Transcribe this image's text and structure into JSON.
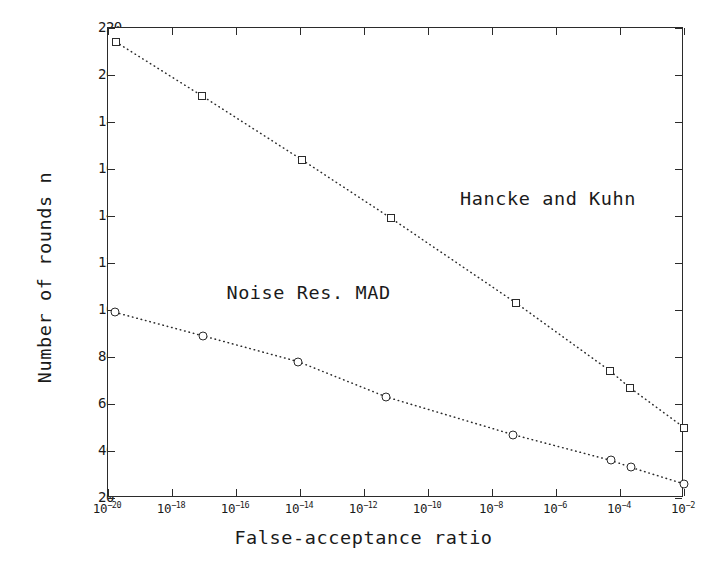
{
  "chart_data": {
    "type": "line",
    "title": "",
    "xlabel": "False-acceptance ratio",
    "ylabel": "Number of rounds n",
    "xscale": "log",
    "xlim": [
      1e-20,
      0.01
    ],
    "ylim": [
      20,
      220
    ],
    "grid": false,
    "legend_position": "inline-annotation",
    "xticklabels": [
      "10⁻²⁰",
      "10⁻¹⁸",
      "10⁻¹⁶",
      "10⁻¹⁴",
      "10⁻¹²",
      "10⁻¹⁰",
      "10⁻⁸",
      "10⁻⁶",
      "10⁻⁴",
      "10⁻²"
    ],
    "xtick_exponents": [
      -20,
      -18,
      -16,
      -14,
      -12,
      -10,
      -8,
      -6,
      -4,
      -2
    ],
    "xtick_base": "10",
    "yticks": [
      20,
      40,
      60,
      80,
      100,
      120,
      140,
      160,
      180,
      200,
      220
    ],
    "series": [
      {
        "name": "Hancke and Kuhn",
        "marker": "square",
        "linestyle": "dotted",
        "color": "#2b2b2b",
        "label_x_exponent": -9.0,
        "label_y": 147,
        "points": [
          {
            "x_exponent": -19.75,
            "y": 214
          },
          {
            "x_exponent": -17.05,
            "y": 191
          },
          {
            "x_exponent": -13.95,
            "y": 164
          },
          {
            "x_exponent": -11.15,
            "y": 139
          },
          {
            "x_exponent": -7.25,
            "y": 103
          },
          {
            "x_exponent": -4.3,
            "y": 74
          },
          {
            "x_exponent": -3.7,
            "y": 67
          },
          {
            "x_exponent": -2.0,
            "y": 50
          }
        ]
      },
      {
        "name": "Noise Res. MAD",
        "marker": "circle",
        "linestyle": "dotted",
        "color": "#2b2b2b",
        "label_x_exponent": -16.3,
        "label_y": 107,
        "points": [
          {
            "x_exponent": -19.78,
            "y": 99
          },
          {
            "x_exponent": -17.03,
            "y": 89
          },
          {
            "x_exponent": -14.05,
            "y": 78
          },
          {
            "x_exponent": -11.3,
            "y": 63
          },
          {
            "x_exponent": -7.35,
            "y": 47
          },
          {
            "x_exponent": -4.28,
            "y": 36
          },
          {
            "x_exponent": -3.65,
            "y": 33
          },
          {
            "x_exponent": -2.0,
            "y": 26
          }
        ]
      }
    ]
  }
}
